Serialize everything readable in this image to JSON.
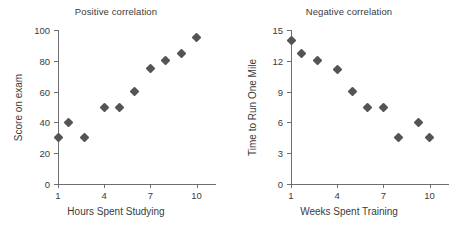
{
  "chart_data": [
    {
      "type": "scatter",
      "title": "Positive correlation",
      "xlabel": "Hours Spent Studying",
      "ylabel": "Score on exam",
      "xlim": [
        1,
        11.2
      ],
      "ylim": [
        0,
        100
      ],
      "xticks": [
        1,
        4,
        7,
        10
      ],
      "xtick_labels": [
        "1",
        "4",
        "7",
        "10"
      ],
      "yticks": [
        0,
        20,
        40,
        60,
        80,
        100
      ],
      "ytick_labels": [
        "0",
        "20",
        "40",
        "60",
        "80",
        "100"
      ],
      "grid": false,
      "legend": "none",
      "marker": "diamond",
      "marker_color": "#545454",
      "x": [
        1,
        1.7,
        2.7,
        4,
        5,
        6,
        7,
        8,
        9,
        10
      ],
      "y": [
        30,
        40,
        30,
        50,
        50,
        60,
        75,
        80,
        85,
        95
      ],
      "points": [
        {
          "x": 1,
          "y": 30
        },
        {
          "x": 1.7,
          "y": 40
        },
        {
          "x": 2.7,
          "y": 30
        },
        {
          "x": 4,
          "y": 50
        },
        {
          "x": 5,
          "y": 50
        },
        {
          "x": 6,
          "y": 60
        },
        {
          "x": 7,
          "y": 75
        },
        {
          "x": 8,
          "y": 80
        },
        {
          "x": 9,
          "y": 85
        },
        {
          "x": 10,
          "y": 95
        }
      ]
    },
    {
      "type": "scatter",
      "title": "Negative correlation",
      "xlabel": "Weeks Spent Training",
      "ylabel": "Time to Run One Mile",
      "xlim": [
        1,
        11.2
      ],
      "ylim": [
        0,
        15
      ],
      "xticks": [
        1,
        4,
        7,
        10
      ],
      "xtick_labels": [
        "1",
        "4",
        "7",
        "10"
      ],
      "yticks": [
        0,
        3,
        6,
        9,
        12,
        15
      ],
      "ytick_labels": [
        "0",
        "3",
        "6",
        "9",
        "12",
        "15"
      ],
      "grid": false,
      "legend": "none",
      "marker": "diamond",
      "marker_color": "#545454",
      "x": [
        1,
        1.7,
        2.7,
        4,
        5,
        6,
        7,
        8,
        9.3,
        10
      ],
      "y": [
        14,
        12.7,
        12,
        11.2,
        9,
        7.5,
        7.5,
        4.5,
        6,
        4.5
      ],
      "points": [
        {
          "x": 1,
          "y": 14
        },
        {
          "x": 1.7,
          "y": 12.7
        },
        {
          "x": 2.7,
          "y": 12
        },
        {
          "x": 4,
          "y": 11.2
        },
        {
          "x": 5,
          "y": 9
        },
        {
          "x": 6,
          "y": 7.5
        },
        {
          "x": 7,
          "y": 7.5
        },
        {
          "x": 8,
          "y": 4.5
        },
        {
          "x": 9.3,
          "y": 6
        },
        {
          "x": 10,
          "y": 4.5
        }
      ]
    }
  ],
  "figure": {
    "background": "#ffffff",
    "axis_color": "#6e6e6e",
    "text_color": "#3b3b3b"
  }
}
